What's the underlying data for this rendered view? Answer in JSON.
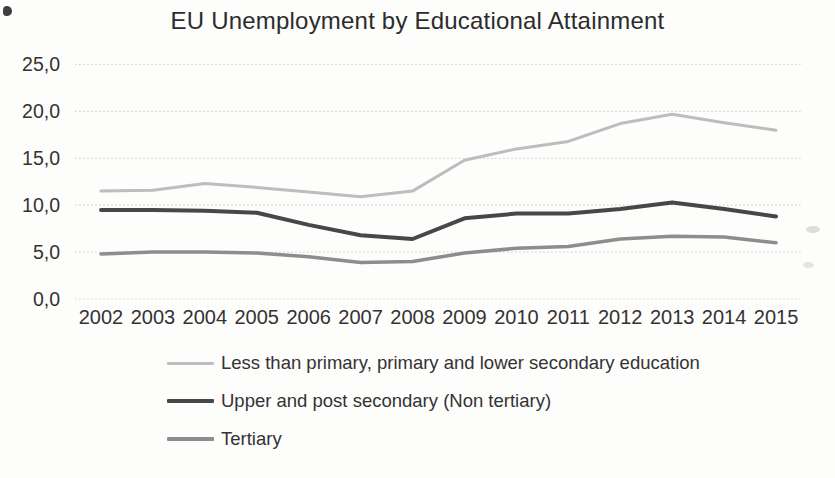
{
  "title": "EU Unemployment by Educational Attainment",
  "chart_data": {
    "type": "line",
    "title": "EU Unemployment by Educational Attainment",
    "categories": [
      "2002",
      "2003",
      "2004",
      "2005",
      "2006",
      "2007",
      "2008",
      "2009",
      "2010",
      "2011",
      "2012",
      "2013",
      "2014",
      "2015"
    ],
    "series": [
      {
        "name": "Less than primary, primary and lower secondary education",
        "color": "#bcbdbc",
        "values": [
          11.5,
          11.6,
          12.3,
          11.9,
          11.4,
          10.9,
          11.5,
          14.8,
          16.0,
          16.8,
          18.7,
          19.7,
          18.8,
          18.0
        ]
      },
      {
        "name": "Upper and post secondary (Non tertiary)",
        "color": "#474747",
        "values": [
          9.5,
          9.5,
          9.4,
          9.2,
          7.9,
          6.8,
          6.4,
          8.6,
          9.1,
          9.1,
          9.6,
          10.3,
          9.6,
          8.8
        ]
      },
      {
        "name": "Tertiary",
        "color": "#8d8d8d",
        "values": [
          4.8,
          5.0,
          5.0,
          4.9,
          4.5,
          3.9,
          4.0,
          4.9,
          5.4,
          5.6,
          6.4,
          6.7,
          6.6,
          6.0
        ]
      }
    ],
    "xlabel": "",
    "ylabel": "",
    "ylim": [
      0,
      25
    ],
    "ytick_step": 5,
    "ytick_labels": [
      "0,0",
      "5,0",
      "10,0",
      "15,0",
      "20,0",
      "25,0"
    ],
    "decimal_separator": ",",
    "grid": true,
    "gridline_style": "dotted",
    "legend_position": "bottom",
    "text_color": "#333333",
    "grid_color": "#d6d6d6",
    "background_color": "#fdfdfc"
  }
}
